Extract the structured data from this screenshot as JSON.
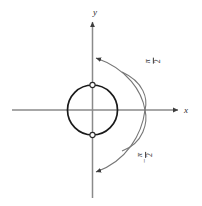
{
  "figure": {
    "name": "unit-circle-rotation-diagram",
    "width": 202,
    "height": 206,
    "background_color": "#ffffff"
  },
  "axes": {
    "x_label": "x",
    "y_label": "y",
    "axis_color": "#8a8a8a",
    "origin": {
      "x": 92.5,
      "y": 110
    },
    "x_axis": {
      "start_x": 12,
      "end_x": 182,
      "y": 110
    },
    "y_axis": {
      "x": 92.5,
      "start_y": 18,
      "end_y": 198
    }
  },
  "circle": {
    "center_x": 92.5,
    "center_y": 110,
    "radius": 25,
    "stroke_color": "#1a1a1a",
    "stroke_width": 1.6,
    "fill": "none"
  },
  "markers": [
    {
      "label": "top-intersection",
      "x": 92.5,
      "y": 85,
      "style": "open-circle"
    },
    {
      "label": "bottom-intersection",
      "x": 92.5,
      "y": 135,
      "style": "open-circle"
    }
  ],
  "arcs": [
    {
      "name": "upper-arc",
      "label": "π/2",
      "numerator": "π",
      "denominator": "2",
      "sign": "",
      "direction": "counterclockwise-to-y-axis",
      "arrow_tip": {
        "x": 94,
        "y": 58
      },
      "crosses_x_axis_at": {
        "x": 145,
        "y": 110
      },
      "stroke_color": "#6f6f6f"
    },
    {
      "name": "lower-arc",
      "label": "−π/2",
      "numerator": "π",
      "denominator": "2",
      "sign": "−",
      "direction": "clockwise-to-y-axis",
      "arrow_tip": {
        "x": 94,
        "y": 172
      },
      "crosses_x_axis_at": {
        "x": 145,
        "y": 110
      },
      "stroke_color": "#6f6f6f"
    }
  ]
}
